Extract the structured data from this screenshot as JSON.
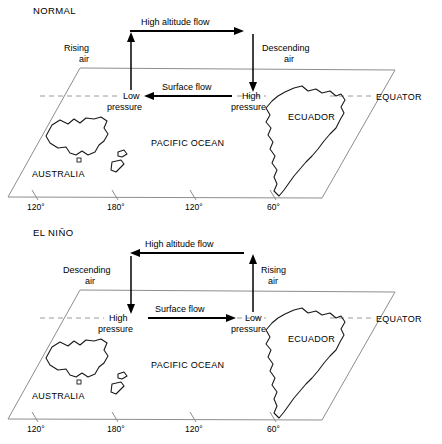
{
  "figure": {
    "type": "diagram",
    "panel_count": 2
  },
  "panels": [
    {
      "id": "normal",
      "title": "NORMAL",
      "high_altitude_flow": {
        "label": "High altitude flow",
        "direction": "right"
      },
      "surface_flow": {
        "label": "Surface flow",
        "direction": "left"
      },
      "left_vertical": {
        "label_line1": "Rising",
        "label_line2": "air",
        "direction": "up"
      },
      "right_vertical": {
        "label_line1": "Descending",
        "label_line2": "air",
        "direction": "down"
      },
      "left_pressure": {
        "line1": "Low",
        "line2": "pressure"
      },
      "right_pressure": {
        "line1": "High",
        "line2": "pressure"
      },
      "ocean_label": "PACIFIC OCEAN",
      "equator_label": "EQUATOR",
      "australia_label": "AUSTRALIA",
      "ecuador_label": "ECUADOR",
      "longitude_ticks": [
        "120°",
        "180°",
        "120°",
        "60°"
      ]
    },
    {
      "id": "elnino",
      "title": "EL NIÑO",
      "high_altitude_flow": {
        "label": "High altitude flow",
        "direction": "left"
      },
      "surface_flow": {
        "label": "Surface flow",
        "direction": "right"
      },
      "left_vertical": {
        "label_line1": "Descending",
        "label_line2": "air",
        "direction": "down"
      },
      "right_vertical": {
        "label_line1": "Rising",
        "label_line2": "air",
        "direction": "up"
      },
      "left_pressure": {
        "line1": "High",
        "line2": "pressure"
      },
      "right_pressure": {
        "line1": "Low",
        "line2": "pressure"
      },
      "ocean_label": "PACIFIC OCEAN",
      "equator_label": "EQUATOR",
      "australia_label": "AUSTRALIA",
      "ecuador_label": "ECUADOR",
      "longitude_ticks": [
        "120°",
        "180°",
        "120°",
        "60°"
      ]
    }
  ],
  "colors": {
    "ink": "#000000",
    "frame": "#8d8d8d",
    "coastline": "#1a1a1a",
    "dashed_equator": "#9a9a9a",
    "background": "#ffffff"
  }
}
